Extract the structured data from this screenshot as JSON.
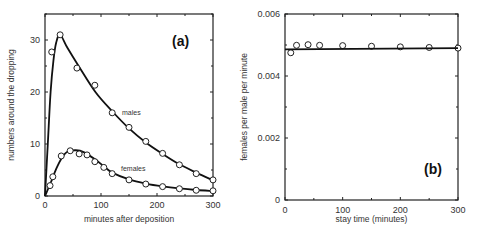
{
  "chart_data": [
    {
      "type": "line",
      "panel_label": "(a)",
      "title": "",
      "xlabel": "minutes after deposition",
      "ylabel": "numbers around the dropping",
      "xlim": [
        0,
        300
      ],
      "ylim": [
        0,
        35
      ],
      "xticks": [
        0,
        100,
        200,
        300
      ],
      "yticks": [
        0,
        10,
        20,
        30
      ],
      "grid": false,
      "legend": "inline labels",
      "series": [
        {
          "name": "males",
          "points": [
            {
              "x": 12,
              "y": 27.7
            },
            {
              "x": 27,
              "y": 31.0
            },
            {
              "x": 57,
              "y": 24.6
            },
            {
              "x": 89,
              "y": 21.3
            },
            {
              "x": 120,
              "y": 16.0
            },
            {
              "x": 150,
              "y": 13.2
            },
            {
              "x": 180,
              "y": 10.5
            },
            {
              "x": 210,
              "y": 8.2
            },
            {
              "x": 240,
              "y": 6.0
            },
            {
              "x": 270,
              "y": 4.3
            },
            {
              "x": 300,
              "y": 3.1
            }
          ],
          "curve": [
            [
              0,
              0
            ],
            [
              5,
              10
            ],
            [
              10,
              20
            ],
            [
              15,
              26
            ],
            [
              20,
              29.5
            ],
            [
              27,
              31
            ],
            [
              40,
              28.5
            ],
            [
              60,
              25
            ],
            [
              90,
              20
            ],
            [
              120,
              16.3
            ],
            [
              150,
              13
            ],
            [
              180,
              10.3
            ],
            [
              210,
              8.1
            ],
            [
              240,
              6.1
            ],
            [
              270,
              4.5
            ],
            [
              300,
              3.0
            ]
          ]
        },
        {
          "name": "females",
          "points": [
            {
              "x": 9,
              "y": 2.0
            },
            {
              "x": 14,
              "y": 3.7
            },
            {
              "x": 29,
              "y": 7.7
            },
            {
              "x": 45,
              "y": 8.7
            },
            {
              "x": 61,
              "y": 8.1
            },
            {
              "x": 75,
              "y": 7.9
            },
            {
              "x": 89,
              "y": 6.6
            },
            {
              "x": 105,
              "y": 5.5
            },
            {
              "x": 120,
              "y": 4.3
            },
            {
              "x": 150,
              "y": 3.1
            },
            {
              "x": 180,
              "y": 2.3
            },
            {
              "x": 210,
              "y": 1.8
            },
            {
              "x": 240,
              "y": 1.4
            },
            {
              "x": 270,
              "y": 1.1
            },
            {
              "x": 300,
              "y": 1.0
            }
          ],
          "curve": [
            [
              0,
              0
            ],
            [
              10,
              2.5
            ],
            [
              20,
              5.2
            ],
            [
              30,
              7.3
            ],
            [
              40,
              8.5
            ],
            [
              55,
              8.8
            ],
            [
              70,
              8.4
            ],
            [
              90,
              7.0
            ],
            [
              105,
              5.7
            ],
            [
              120,
              4.5
            ],
            [
              150,
              3.2
            ],
            [
              180,
              2.4
            ],
            [
              210,
              1.85
            ],
            [
              240,
              1.45
            ],
            [
              270,
              1.15
            ],
            [
              300,
              0.95
            ]
          ]
        }
      ]
    },
    {
      "type": "scatter",
      "panel_label": "(b)",
      "title": "",
      "xlabel": "stay time (minutes)",
      "ylabel": "females per male per minute",
      "xlim": [
        0,
        300
      ],
      "ylim": [
        0,
        0.006
      ],
      "xticks": [
        0,
        100,
        200,
        300
      ],
      "yticks": [
        0,
        0.002,
        0.004,
        0.006
      ],
      "ytick_labels": [
        "0",
        "0.002",
        "0.004",
        "0.006"
      ],
      "grid": false,
      "series": [
        {
          "name": "observed",
          "points": [
            {
              "x": 10,
              "y": 0.00475
            },
            {
              "x": 20,
              "y": 0.00499
            },
            {
              "x": 40,
              "y": 0.00501
            },
            {
              "x": 60,
              "y": 0.00499
            },
            {
              "x": 100,
              "y": 0.00498
            },
            {
              "x": 150,
              "y": 0.00496
            },
            {
              "x": 200,
              "y": 0.00494
            },
            {
              "x": 250,
              "y": 0.00492
            },
            {
              "x": 300,
              "y": 0.0049
            }
          ]
        },
        {
          "name": "fit",
          "line": [
            [
              0,
              0.00486
            ],
            [
              300,
              0.0049
            ]
          ]
        }
      ]
    }
  ],
  "caption_fragment": ""
}
